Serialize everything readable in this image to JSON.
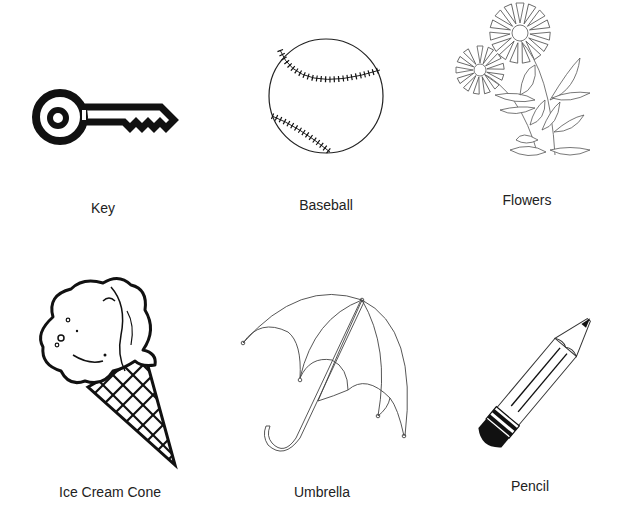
{
  "worksheet": {
    "items": [
      {
        "name": "Key",
        "icon": "key-icon"
      },
      {
        "name": "Baseball",
        "icon": "baseball-icon"
      },
      {
        "name": "Flowers",
        "icon": "flowers-icon"
      },
      {
        "name": "Ice Cream Cone",
        "icon": "ice-cream-cone-icon"
      },
      {
        "name": "Umbrella",
        "icon": "umbrella-icon"
      },
      {
        "name": "Pencil",
        "icon": "pencil-icon"
      }
    ]
  },
  "colors": {
    "ink": "#111111",
    "label": "#222222",
    "background": "#ffffff"
  }
}
